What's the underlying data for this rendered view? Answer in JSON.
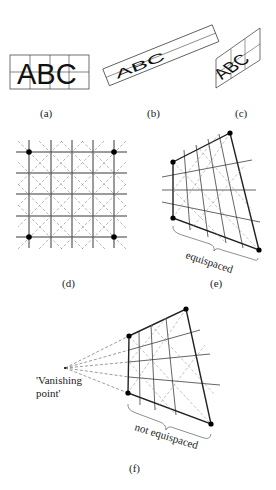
{
  "figure": {
    "panels": [
      {
        "id": "a",
        "caption": "(a)",
        "text": "ABC"
      },
      {
        "id": "b",
        "caption": "(b)",
        "text": "ABC"
      },
      {
        "id": "c",
        "caption": "(c)",
        "text": "ABC"
      },
      {
        "id": "d",
        "caption": "(d)"
      },
      {
        "id": "e",
        "caption": "(e)",
        "annotation": "equispaced"
      },
      {
        "id": "f",
        "caption": "(f)",
        "annotation": "not equispaced",
        "vanishing_label_1": "'Vanishing",
        "vanishing_label_2": "point'"
      }
    ]
  }
}
